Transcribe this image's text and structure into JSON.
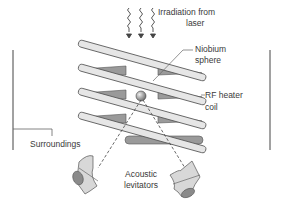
{
  "diagram": {
    "labels": {
      "irradiation_line1": "Irradiation from",
      "irradiation_line2": "laser",
      "niobium_line1": "Niobium",
      "niobium_line2": "sphere",
      "rf_line1": "RF heater",
      "rf_line2": "coil",
      "surroundings": "Surroundings",
      "acoustic_line1": "Acoustic",
      "acoustic_line2": "levitators"
    },
    "colors": {
      "coil_fill": "#e6e6e6",
      "coil_shadow": "#9a9a9a",
      "stroke": "#555555",
      "sphere": "#8c8c8c",
      "levitator_fill": "#d8d8d8",
      "levitator_dark": "#8a8a8a",
      "text": "#3a3a3a"
    },
    "icons": [
      "wavy-arrow-icon",
      "wavy-arrow-icon",
      "wavy-arrow-icon"
    ]
  }
}
